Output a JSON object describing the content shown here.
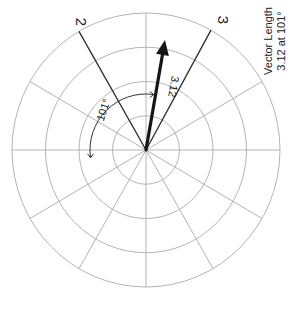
{
  "diagram": {
    "type": "polar-vector-plot",
    "center": {
      "x": 146,
      "y": 150
    },
    "radius": {
      "x": 134,
      "y": 137
    },
    "rings": 4,
    "spoke_angles_deg": [
      0,
      30,
      90,
      150,
      180,
      210,
      240,
      270,
      300,
      330
    ],
    "grid_color": "#b4b4b4",
    "reference_lines": [
      {
        "label": "2",
        "angle_deg": 120,
        "label_pos": {
          "x": 76,
          "y": 22
        }
      },
      {
        "label": "3",
        "angle_deg": 61,
        "label_pos": {
          "x": 218,
          "y": 20
        }
      }
    ],
    "vector": {
      "length_label": "3.12",
      "angle_deg": 80,
      "tip": {
        "x": 165,
        "y": 40
      },
      "label_pos": {
        "x": 170,
        "y": 86
      },
      "color": "#151515"
    },
    "angle_arc": {
      "label": "101°",
      "radius": 56,
      "label_pos": {
        "x": 107,
        "y": 111
      }
    },
    "annotation": {
      "line1": "Vector Length",
      "line2": "3.12 at 101°"
    }
  }
}
